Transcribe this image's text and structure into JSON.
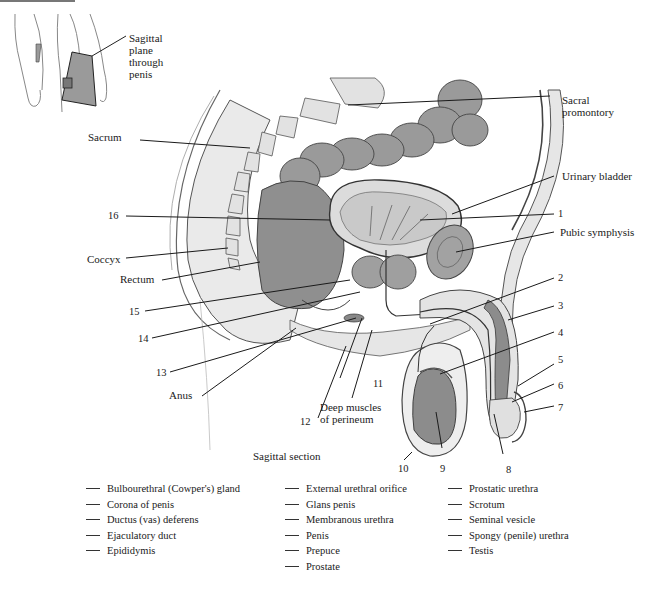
{
  "inset": {
    "label": "Sagittal plane through penis",
    "label_lines": [
      "Sagittal",
      "plane",
      "through",
      "penis"
    ]
  },
  "labels": {
    "sacral_promontory": [
      "Sacral",
      "promontory"
    ],
    "sacrum": "Sacrum",
    "urinary_bladder": "Urinary bladder",
    "pubic_symphysis": "Pubic symphysis",
    "coccyx": "Coccyx",
    "rectum": "Rectum",
    "anus": "Anus",
    "deep_muscles": [
      "Deep muscles",
      "of perineum"
    ],
    "caption": "Sagittal section"
  },
  "numbers": [
    "1",
    "2",
    "3",
    "4",
    "5",
    "6",
    "7",
    "8",
    "9",
    "10",
    "11",
    "12",
    "13",
    "14",
    "15",
    "16"
  ],
  "word_bank": {
    "columns": [
      [
        "Bulbourethral (Cowper's) gland",
        "Corona of penis",
        "Ductus (vas) deferens",
        "Ejaculatory duct",
        "Epididymis"
      ],
      [
        "External urethral orifice",
        "Glans penis",
        "Membranous urethra",
        "Penis",
        "Prepuce",
        "Prostate"
      ],
      [
        "Prostatic urethra",
        "Scrotum",
        "Seminal vesicle",
        "Spongy (penile) urethra",
        "Testis"
      ]
    ]
  },
  "colors": {
    "organ_dark": "#8a8a8a",
    "organ_mid": "#a9a9a9",
    "tissue_light": "#e6e6e6",
    "line": "#1a1a1a"
  }
}
